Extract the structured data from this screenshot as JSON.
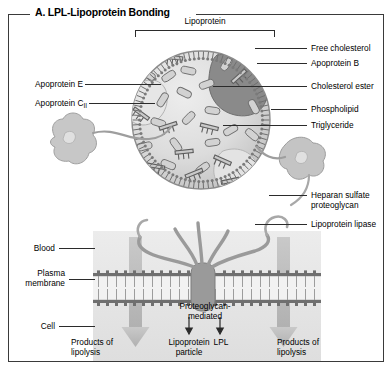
{
  "figure": {
    "title": "A. LPL-Lipoprotein Bonding"
  },
  "bracket_label": "Lipoprotein",
  "labels_right_upper": [
    {
      "text": "Free cholesterol"
    },
    {
      "text": "Apoprotein B"
    },
    {
      "text": "Cholesterol ester"
    },
    {
      "text": "Phospholipid"
    },
    {
      "text": "Triglyceride"
    }
  ],
  "labels_right_lower": [
    {
      "line1": "Heparan sulfate",
      "line2": "proteoglycan"
    },
    {
      "line1": "Lipoprotein lipase",
      "line2": ""
    }
  ],
  "labels_left_upper": [
    {
      "text": "Apoprotein E"
    },
    {
      "text": "Apoprotein C",
      "sub": "II"
    }
  ],
  "labels_left_lower": [
    {
      "text": "Blood"
    },
    {
      "line1": "Plasma",
      "line2": "membrane"
    },
    {
      "text": "Cell"
    }
  ],
  "bottom": {
    "left_product_line1": "Products of",
    "left_product_line2": "lipolysis",
    "right_product_line1": "Products of",
    "right_product_line2": "lipolysis",
    "center_line1": "Proteoglycan-",
    "center_line2": "mediated",
    "particle_line1": "Lipoprotein",
    "particle_line2": "particle",
    "lpl": "LPL"
  },
  "colors": {
    "ink": "#2b2b2b",
    "frame": "#3a3a3a",
    "particle_fill": "#dcdcdc",
    "particle_stroke": "#8c8c8c",
    "apo_b_fill": "#8a8a8a",
    "membrane_band": "#e3e3e3",
    "arrow_gray": "#b9b9b9",
    "protein_gray": "#9a9a9a"
  }
}
